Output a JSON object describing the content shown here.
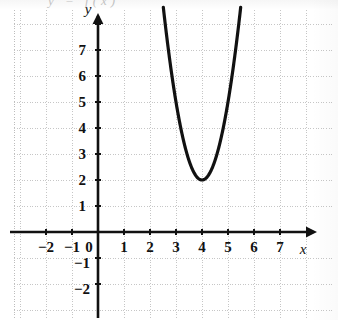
{
  "figure": {
    "title_fragment": "y = f(x)",
    "axis_label_x": "x",
    "axis_label_y": "y",
    "origin_label": "0"
  },
  "chart_data": {
    "type": "line",
    "title": "",
    "subtitle": "",
    "xlabel": "x",
    "ylabel": "y",
    "xlim": [
      -2.6,
      7.9
    ],
    "ylim": [
      -2.8,
      8.3
    ],
    "grid": true,
    "grid_style": "dotted",
    "legend": "none",
    "x_ticks": [
      -2,
      -1,
      0,
      1,
      2,
      3,
      4,
      5,
      6,
      7
    ],
    "x_tick_labels": [
      "−2",
      "−1",
      "0",
      "1",
      "2",
      "3",
      "4",
      "5",
      "6",
      "7"
    ],
    "y_ticks": [
      -2,
      -1,
      1,
      2,
      3,
      4,
      5,
      6,
      7
    ],
    "y_tick_labels": [
      "−2",
      "−1",
      "1",
      "2",
      "3",
      "4",
      "5",
      "6",
      "7"
    ],
    "x_axis_arrow": true,
    "y_axis_arrow": true,
    "curve_color": "#111111",
    "axis_color": "#111111",
    "grid_color": "#c9c9c9",
    "series": [
      {
        "name": "parabola",
        "equation": "y = 3(x - 4)^2 + 2",
        "vertex": [
          4,
          2
        ],
        "opens": "up",
        "coefficient_a": 3,
        "x": [
          2.55,
          2.7,
          2.9,
          3.1,
          3.3,
          3.5,
          3.7,
          3.9,
          4.0,
          4.1,
          4.3,
          4.5,
          4.7,
          4.9,
          5.1,
          5.3,
          5.45
        ],
        "values": [
          8.4,
          7.07,
          5.63,
          4.43,
          3.47,
          2.75,
          2.27,
          2.03,
          2.0,
          2.03,
          2.27,
          2.75,
          3.47,
          4.43,
          5.63,
          7.07,
          8.3
        ]
      }
    ],
    "annotations": [
      {
        "text": "vertex",
        "x": 4,
        "y": 2,
        "visible": false
      }
    ]
  }
}
